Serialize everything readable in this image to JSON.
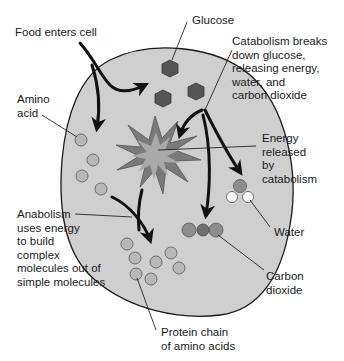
{
  "colors": {
    "cell_fill": "#cfcfcf",
    "cell_stroke": "#1a1a1a",
    "glucose": "#555555",
    "amino_acid": "#b8b8b8",
    "burst_outer": "#777777",
    "burst_inner": "#a9a9a9",
    "oxygen_carbon": "#8e8e8e",
    "hydrogen": "#ffffff",
    "carbon_center": "#6f6f6f",
    "arrow": "#111111",
    "label_text": "#1a1a1a"
  },
  "labels": {
    "food": [
      "Food enters cell"
    ],
    "glucose": [
      "Glucose"
    ],
    "catabolism": [
      "Catabolism breaks",
      "down glucose,",
      "releasing energy,",
      "water, and",
      "carbon dioxide"
    ],
    "amino": [
      "Amino",
      "acid"
    ],
    "energy": [
      "Energy",
      "released",
      "by",
      "catabolism"
    ],
    "anabolism": [
      "Anabolism",
      "uses energy",
      "to build",
      "complex",
      "molecules out of",
      "simple molecules"
    ],
    "water": [
      "Water"
    ],
    "co2": [
      "Carbon",
      "dioxide"
    ],
    "protein": [
      "Protein chain",
      "of amino acids"
    ]
  },
  "molecules": {
    "glucose_count": 3,
    "free_amino_acids": 4,
    "protein_chain_links": 7,
    "water_atoms": [
      "O",
      "H",
      "H"
    ],
    "co2_atoms": [
      "O",
      "C",
      "O"
    ]
  }
}
